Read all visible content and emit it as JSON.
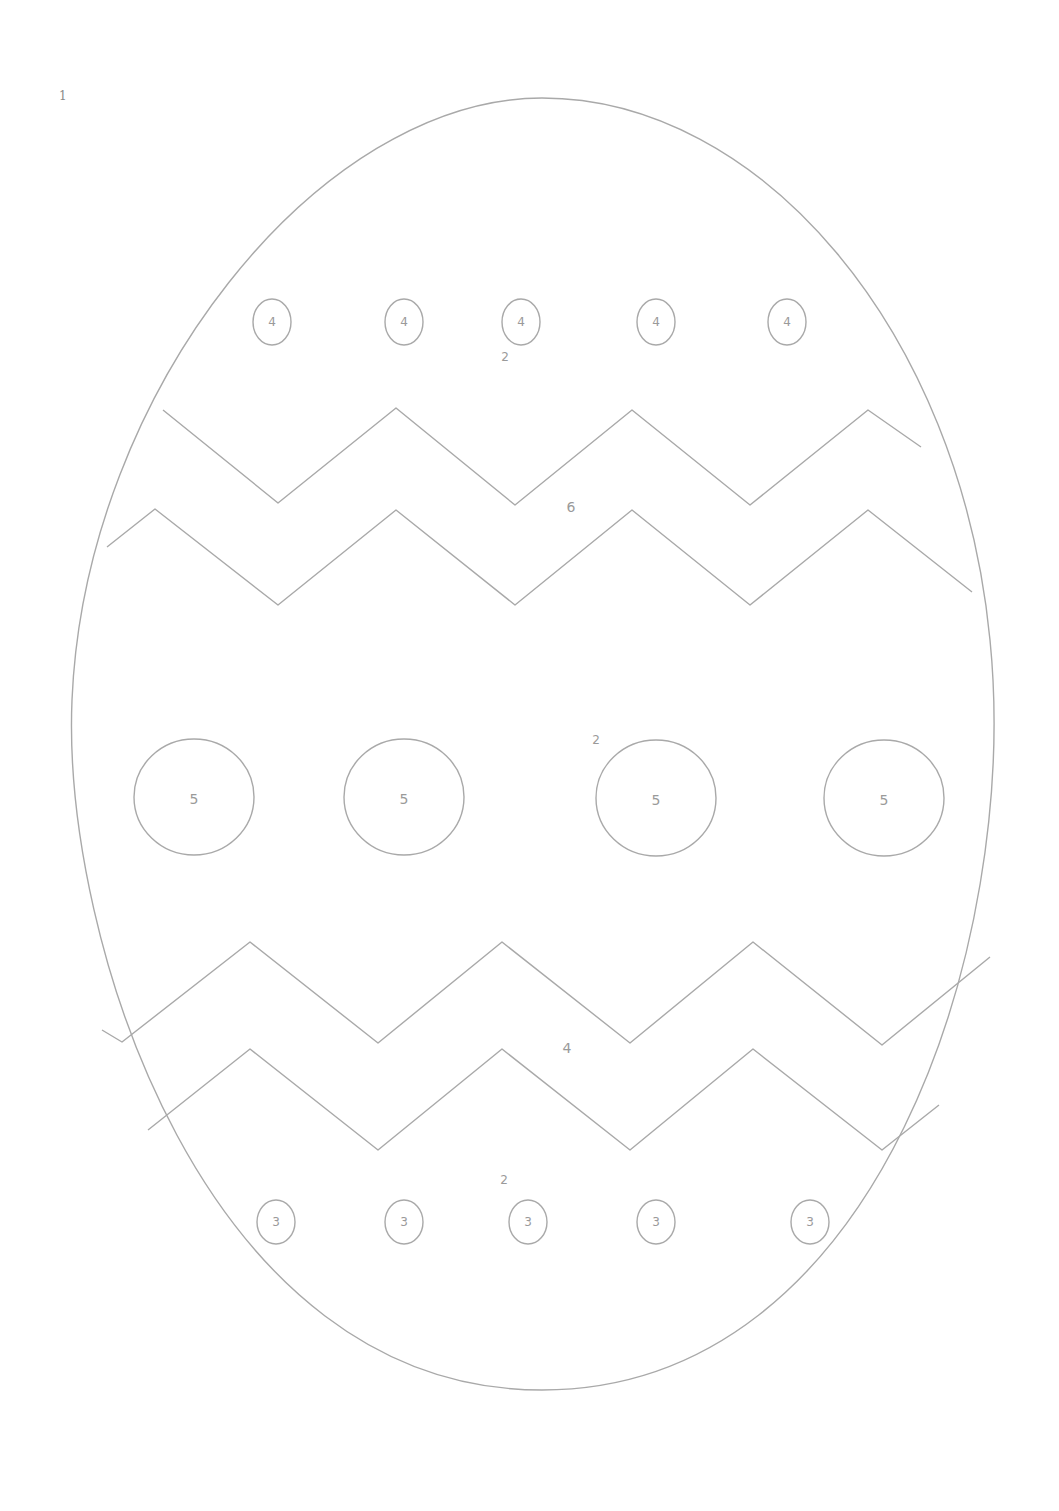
{
  "page": {
    "number": "1"
  },
  "colors": {
    "line": "#a9a9a9",
    "text": "#9a9a9a",
    "background": "#ffffff"
  },
  "regions": {
    "top_area": {
      "label": "2",
      "x": 505,
      "y": 357
    },
    "upper_zigzag_band": {
      "label": "6",
      "x": 571,
      "y": 507
    },
    "middle_area": {
      "label": "2",
      "x": 596,
      "y": 740
    },
    "lower_zigzag_band": {
      "label": "4",
      "x": 567,
      "y": 1048
    },
    "bottom_area": {
      "label": "2",
      "x": 504,
      "y": 1180
    }
  },
  "top_dots": {
    "label": "4",
    "items": [
      {
        "label": "4",
        "cx": 272,
        "cy": 322
      },
      {
        "label": "4",
        "cx": 404,
        "cy": 322
      },
      {
        "label": "4",
        "cx": 521,
        "cy": 322
      },
      {
        "label": "4",
        "cx": 656,
        "cy": 322
      },
      {
        "label": "4",
        "cx": 787,
        "cy": 322
      }
    ]
  },
  "middle_dots": {
    "label": "5",
    "items": [
      {
        "label": "5",
        "cx": 194,
        "cy": 797
      },
      {
        "label": "5",
        "cx": 404,
        "cy": 797
      },
      {
        "label": "5",
        "cx": 656,
        "cy": 798
      },
      {
        "label": "5",
        "cx": 884,
        "cy": 798
      }
    ]
  },
  "bottom_dots": {
    "label": "3",
    "items": [
      {
        "label": "3",
        "cx": 276,
        "cy": 1222
      },
      {
        "label": "3",
        "cx": 404,
        "cy": 1222
      },
      {
        "label": "3",
        "cx": 528,
        "cy": 1222
      },
      {
        "label": "3",
        "cx": 656,
        "cy": 1222
      },
      {
        "label": "3",
        "cx": 810,
        "cy": 1222
      }
    ]
  }
}
